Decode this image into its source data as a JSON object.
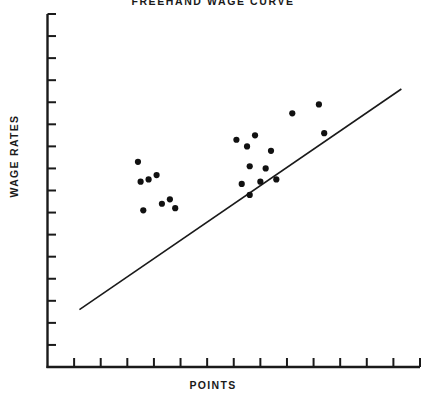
{
  "chart_data": {
    "type": "scatter",
    "title": "FREEHAND WAGE CURVE",
    "xlabel": "POINTS",
    "ylabel": "WAGE RATES",
    "grid": false,
    "legend": null,
    "axis_tick_labels": {
      "x": [],
      "y": []
    },
    "xlim": [
      0,
      14
    ],
    "ylim": [
      0,
      16
    ],
    "x_tick_count": 14,
    "y_tick_count": 16,
    "points": [
      {
        "x": 3.4,
        "y": 9.3
      },
      {
        "x": 4.1,
        "y": 8.7
      },
      {
        "x": 3.5,
        "y": 8.4
      },
      {
        "x": 3.8,
        "y": 8.5
      },
      {
        "x": 4.3,
        "y": 7.4
      },
      {
        "x": 4.6,
        "y": 7.6
      },
      {
        "x": 3.6,
        "y": 7.1
      },
      {
        "x": 4.8,
        "y": 7.2
      },
      {
        "x": 7.1,
        "y": 10.3
      },
      {
        "x": 7.8,
        "y": 10.5
      },
      {
        "x": 7.5,
        "y": 10.0
      },
      {
        "x": 8.4,
        "y": 9.8
      },
      {
        "x": 7.6,
        "y": 9.1
      },
      {
        "x": 8.2,
        "y": 9.0
      },
      {
        "x": 8.0,
        "y": 8.4
      },
      {
        "x": 8.6,
        "y": 8.5
      },
      {
        "x": 7.3,
        "y": 8.3
      },
      {
        "x": 7.6,
        "y": 7.8
      },
      {
        "x": 9.2,
        "y": 11.5
      },
      {
        "x": 10.2,
        "y": 11.9
      },
      {
        "x": 10.4,
        "y": 10.6
      }
    ],
    "fit_line": {
      "name": "freehand wage curve",
      "x0": 1.2,
      "y0": 2.6,
      "x1": 13.3,
      "y1": 12.6
    },
    "marker": {
      "shape": "circle",
      "radius_px": 3.1,
      "color": "#111111"
    },
    "colors": {
      "axis": "#1a1a1a",
      "line": "#1a1a1a",
      "marker": "#111111",
      "background": "#ffffff"
    }
  }
}
